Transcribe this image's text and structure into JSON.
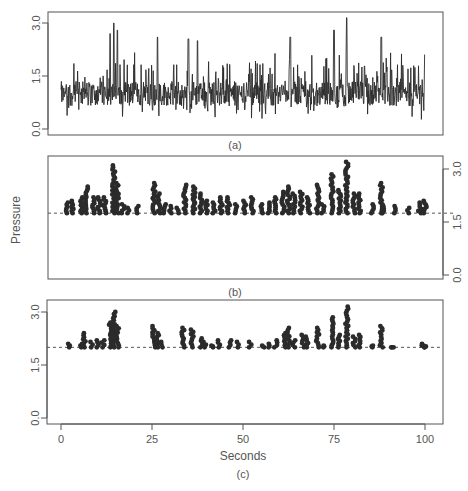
{
  "chart_data": [
    {
      "panel": "a",
      "type": "line",
      "caption": "(a)",
      "title": "",
      "xlabel": "",
      "ylabel": "",
      "ylim": [
        0.0,
        3.0
      ],
      "yticks": [
        0.0,
        1.5,
        3.0
      ],
      "ytick_labels": [
        "0.0",
        "1.5",
        "3.0"
      ],
      "ytick_side": "left",
      "xlim": [
        0,
        100
      ],
      "grid": false,
      "description": "Dense noisy pressure time series, ~0.1-3.0, mean ≈1.0",
      "series": [
        {
          "name": "pressure",
          "baseline_mean": 1.0,
          "min": 0.1,
          "max": 3.0,
          "notable_peaks": [
            {
              "x": 14.5,
              "y": 3.0
            },
            {
              "x": 13.5,
              "y": 2.7
            },
            {
              "x": 15.5,
              "y": 2.8
            },
            {
              "x": 26.5,
              "y": 2.6
            },
            {
              "x": 35,
              "y": 2.55
            },
            {
              "x": 37.5,
              "y": 2.5
            },
            {
              "x": 63,
              "y": 2.6
            },
            {
              "x": 75,
              "y": 2.8
            },
            {
              "x": 78.5,
              "y": 3.15
            },
            {
              "x": 88,
              "y": 2.6
            },
            {
              "x": 100,
              "y": 2.1
            }
          ]
        }
      ]
    },
    {
      "panel": "b",
      "type": "scatter",
      "caption": "(b)",
      "ylabel": "Pressure",
      "xlabel": "",
      "ylim": [
        0.0,
        3.0
      ],
      "yticks": [
        0.0,
        1.5,
        3.0
      ],
      "ytick_labels": [
        "0.0",
        "1.5",
        "3.0"
      ],
      "ytick_side": "right",
      "xlim": [
        0,
        100
      ],
      "threshold": 1.75,
      "threshold_style": "dashed",
      "grid": false,
      "series": [
        {
          "name": "exceedances",
          "clusters": [
            {
              "x": 1.5,
              "ymax": 2.05
            },
            {
              "x": 3,
              "ymax": 2.1
            },
            {
              "x": 5.5,
              "ymax": 2.2
            },
            {
              "x": 7,
              "ymax": 2.5
            },
            {
              "x": 9,
              "ymax": 2.2
            },
            {
              "x": 10.5,
              "ymax": 2.2
            },
            {
              "x": 12,
              "ymax": 2.2
            },
            {
              "x": 14.5,
              "ymax": 3.1
            },
            {
              "x": 15.5,
              "ymax": 2.6
            },
            {
              "x": 17,
              "ymax": 2.0
            },
            {
              "x": 18.5,
              "ymax": 1.9
            },
            {
              "x": 21,
              "ymax": 1.95
            },
            {
              "x": 25.5,
              "ymax": 2.6
            },
            {
              "x": 27,
              "ymax": 2.3
            },
            {
              "x": 28.5,
              "ymax": 2.0
            },
            {
              "x": 30,
              "ymax": 1.95
            },
            {
              "x": 32,
              "ymax": 1.9
            },
            {
              "x": 34,
              "ymax": 2.55
            },
            {
              "x": 36.5,
              "ymax": 2.5
            },
            {
              "x": 38.5,
              "ymax": 2.3
            },
            {
              "x": 40,
              "ymax": 2.1
            },
            {
              "x": 42,
              "ymax": 2.05
            },
            {
              "x": 44,
              "ymax": 2.2
            },
            {
              "x": 46,
              "ymax": 2.2
            },
            {
              "x": 48,
              "ymax": 2.0
            },
            {
              "x": 50.5,
              "ymax": 2.1
            },
            {
              "x": 52.5,
              "ymax": 2.2
            },
            {
              "x": 55,
              "ymax": 2.0
            },
            {
              "x": 57,
              "ymax": 2.05
            },
            {
              "x": 59,
              "ymax": 2.2
            },
            {
              "x": 61,
              "ymax": 2.35
            },
            {
              "x": 62.5,
              "ymax": 2.5
            },
            {
              "x": 64,
              "ymax": 2.3
            },
            {
              "x": 66,
              "ymax": 2.35
            },
            {
              "x": 68,
              "ymax": 2.2
            },
            {
              "x": 70.5,
              "ymax": 2.55
            },
            {
              "x": 72,
              "ymax": 2.0
            },
            {
              "x": 74.5,
              "ymax": 2.85
            },
            {
              "x": 76.5,
              "ymax": 2.4
            },
            {
              "x": 78.5,
              "ymax": 3.2
            },
            {
              "x": 80.5,
              "ymax": 2.3
            },
            {
              "x": 82,
              "ymax": 2.3
            },
            {
              "x": 85.5,
              "ymax": 2.0
            },
            {
              "x": 88,
              "ymax": 2.6
            },
            {
              "x": 88.5,
              "ymax": 2.0
            },
            {
              "x": 91.5,
              "ymax": 1.95
            },
            {
              "x": 95.5,
              "ymax": 1.9
            },
            {
              "x": 98.5,
              "ymax": 2.05
            },
            {
              "x": 100,
              "ymax": 2.1
            }
          ]
        }
      ]
    },
    {
      "panel": "c",
      "type": "scatter",
      "caption": "(c)",
      "xlabel": "Seconds",
      "ylabel": "",
      "xlim": [
        0,
        100
      ],
      "xticks": [
        0,
        25,
        50,
        75,
        100
      ],
      "xtick_labels": [
        "0",
        "25",
        "50",
        "75",
        "100"
      ],
      "ylim": [
        0.0,
        3.0
      ],
      "yticks": [
        0.0,
        1.5,
        3.0
      ],
      "ytick_labels": [
        "0.0",
        "1.5",
        "3.0"
      ],
      "ytick_side": "left",
      "threshold": 2.0,
      "threshold_style": "dashed",
      "grid": false,
      "series": [
        {
          "name": "exceedances",
          "clusters": [
            {
              "x": 2,
              "ymax": 2.1
            },
            {
              "x": 5.5,
              "ymax": 2.1
            },
            {
              "x": 6.5,
              "ymax": 2.4
            },
            {
              "x": 8.5,
              "ymax": 2.15
            },
            {
              "x": 10,
              "ymax": 2.2
            },
            {
              "x": 11.5,
              "ymax": 2.2
            },
            {
              "x": 13.5,
              "ymax": 2.7
            },
            {
              "x": 14.5,
              "ymax": 3.0
            },
            {
              "x": 15.5,
              "ymax": 2.6
            },
            {
              "x": 25.5,
              "ymax": 2.6
            },
            {
              "x": 26.5,
              "ymax": 2.4
            },
            {
              "x": 27.5,
              "ymax": 2.15
            },
            {
              "x": 33.5,
              "ymax": 2.55
            },
            {
              "x": 36,
              "ymax": 2.5
            },
            {
              "x": 38.5,
              "ymax": 2.25
            },
            {
              "x": 39.5,
              "ymax": 2.15
            },
            {
              "x": 41.5,
              "ymax": 2.05
            },
            {
              "x": 43.5,
              "ymax": 2.2
            },
            {
              "x": 46.5,
              "ymax": 2.2
            },
            {
              "x": 48.5,
              "ymax": 2.15
            },
            {
              "x": 52,
              "ymax": 2.15
            },
            {
              "x": 55.5,
              "ymax": 2.05
            },
            {
              "x": 57,
              "ymax": 2.1
            },
            {
              "x": 59,
              "ymax": 2.2
            },
            {
              "x": 61.5,
              "ymax": 2.4
            },
            {
              "x": 62.5,
              "ymax": 2.55
            },
            {
              "x": 64,
              "ymax": 2.2
            },
            {
              "x": 66.5,
              "ymax": 2.35
            },
            {
              "x": 67.5,
              "ymax": 2.3
            },
            {
              "x": 70.5,
              "ymax": 2.55
            },
            {
              "x": 72,
              "ymax": 2.05
            },
            {
              "x": 74.5,
              "ymax": 2.85
            },
            {
              "x": 76.5,
              "ymax": 2.35
            },
            {
              "x": 78.5,
              "ymax": 3.15
            },
            {
              "x": 80.5,
              "ymax": 2.3
            },
            {
              "x": 82,
              "ymax": 2.35
            },
            {
              "x": 85.5,
              "ymax": 2.05
            },
            {
              "x": 88,
              "ymax": 2.6
            },
            {
              "x": 91,
              "ymax": 2.0
            },
            {
              "x": 99.5,
              "ymax": 2.1
            },
            {
              "x": 100,
              "ymax": 2.05
            }
          ]
        }
      ]
    }
  ],
  "labels": {
    "caption_a": "(a)",
    "caption_b": "(b)",
    "caption_c": "(c)",
    "ylabel": "Pressure",
    "xlabel": "Seconds",
    "yticks": [
      "0.0",
      "1.5",
      "3.0"
    ],
    "xticks": [
      "0",
      "25",
      "50",
      "75",
      "100"
    ]
  },
  "colors": {
    "ink": "#2b2b2b",
    "axis": "#555555",
    "text": "#555555",
    "background": "#ffffff"
  }
}
